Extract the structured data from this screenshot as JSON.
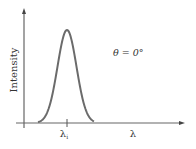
{
  "chart_data": {
    "type": "line",
    "title": "",
    "xlabel": "λ",
    "ylabel": "Intensity",
    "annotation": "θ = 0°",
    "x_ticks": [
      {
        "label": "λ",
        "sub": "i",
        "position": "peak"
      }
    ],
    "series": [
      {
        "name": "intensity spectrum",
        "shape": "gaussian peak",
        "center": "λi",
        "x": [
          40,
          45,
          50,
          55,
          60,
          63,
          67,
          71,
          74,
          79,
          84,
          89,
          92
        ],
        "values": [
          0,
          0.05,
          0.25,
          0.62,
          0.92,
          0.99,
          1.0,
          0.99,
          0.92,
          0.62,
          0.25,
          0.05,
          0
        ]
      }
    ],
    "grid": false,
    "legend": "none",
    "colors": {
      "curve": "#6b6b6b",
      "axes": "#555555",
      "text": "#333333"
    }
  },
  "labels": {
    "ylabel": "Intensity",
    "xlabel": "λ",
    "tick_main": "λ",
    "tick_sub": "i",
    "annotation": "θ = 0°"
  }
}
